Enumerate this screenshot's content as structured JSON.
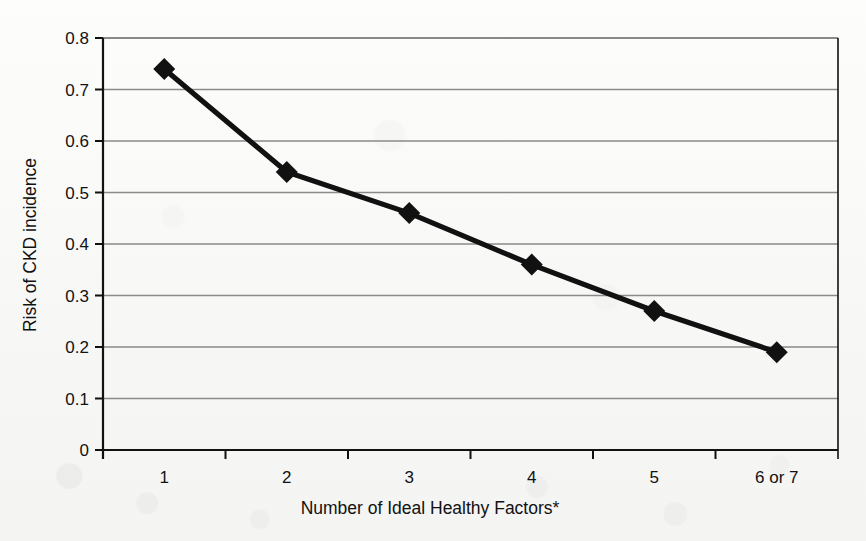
{
  "chart_data": {
    "type": "line",
    "title": "",
    "xlabel": "Number of Ideal Healthy Factors*",
    "ylabel": "Risk of CKD incidence",
    "categories": [
      "1",
      "2",
      "3",
      "4",
      "5",
      "6 or 7"
    ],
    "values": [
      0.74,
      0.54,
      0.46,
      0.36,
      0.27,
      0.19
    ],
    "ylim": [
      0,
      0.8
    ],
    "yticks": [
      "0",
      "0.1",
      "0.2",
      "0.3",
      "0.4",
      "0.5",
      "0.6",
      "0.7",
      "0.8"
    ],
    "ytick_values": [
      0,
      0.1,
      0.2,
      0.3,
      0.4,
      0.5,
      0.6,
      0.7,
      0.8
    ],
    "grid": "horizontal",
    "legend": "none",
    "marker": "diamond",
    "series": [
      {
        "name": "Risk of CKD incidence",
        "values": [
          0.74,
          0.54,
          0.46,
          0.36,
          0.27,
          0.19
        ]
      }
    ],
    "colors": {
      "line": "#111111",
      "marker": "#111111",
      "grid": "#8a8a8a",
      "axis": "#111111",
      "background": "#fbfbfa",
      "text": "#121212"
    }
  },
  "footnote": "*"
}
